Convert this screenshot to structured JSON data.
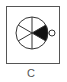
{
  "figure": {
    "label": "C",
    "diagram": {
      "type": "segmented-circle",
      "segments": 6,
      "filled_segment": "right",
      "fill_color": "#111111",
      "stroke_color": "#333333",
      "frame_color": "#555555",
      "marker": "small-open-circle-right"
    }
  }
}
